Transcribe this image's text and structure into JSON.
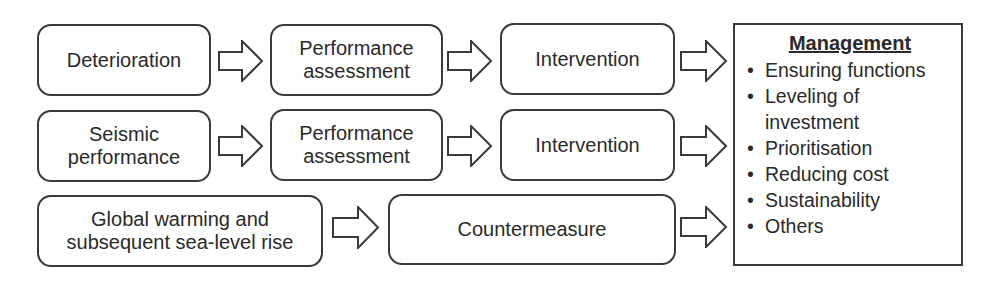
{
  "rows": [
    {
      "source": {
        "lines": [
          "Deterioration"
        ]
      },
      "steps": [
        {
          "lines": [
            "Performance",
            "assessment"
          ]
        },
        {
          "lines": [
            "Intervention"
          ]
        }
      ]
    },
    {
      "source": {
        "lines": [
          "Seismic",
          "performance"
        ]
      },
      "steps": [
        {
          "lines": [
            "Performance",
            "assessment"
          ]
        },
        {
          "lines": [
            "Intervention"
          ]
        }
      ]
    },
    {
      "source": {
        "lines": [
          "Global warming and",
          "subsequent sea-level rise"
        ]
      },
      "steps": [
        {
          "lines": [
            "Countermeasure"
          ]
        }
      ]
    }
  ],
  "management": {
    "title": "Management",
    "bullet": "•",
    "items": [
      {
        "lines": [
          "Ensuring functions"
        ]
      },
      {
        "lines": [
          "Leveling of",
          "investment"
        ]
      },
      {
        "lines": [
          "Prioritisation"
        ]
      },
      {
        "lines": [
          "Reducing cost"
        ]
      },
      {
        "lines": [
          "Sustainability"
        ]
      },
      {
        "lines": [
          "Others"
        ]
      }
    ]
  },
  "colors": {
    "stroke": "#3a3a3a",
    "background": "#ffffff",
    "text": "#2a2a2a"
  }
}
